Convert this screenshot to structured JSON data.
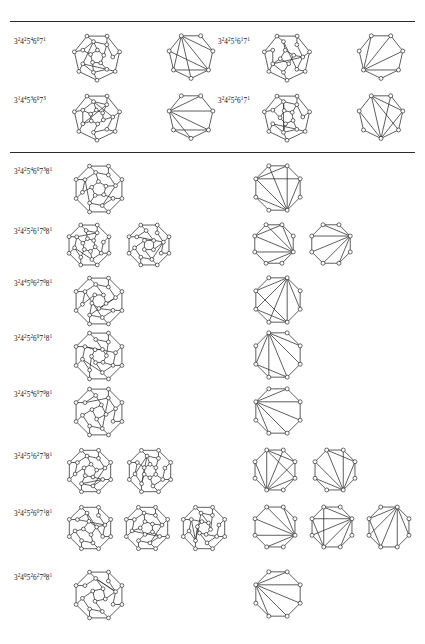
{
  "page": {
    "kind": "figure-plate",
    "width": 425,
    "height": 644,
    "background": "#ffffff",
    "ink": "#2a2a2a"
  },
  "rules": [
    {
      "name": "top-rule",
      "y": 21
    },
    {
      "name": "section-divider-rule",
      "y": 152
    }
  ],
  "notation": {
    "base_symbols": [
      "3",
      "4",
      "5",
      "6",
      "7",
      "8"
    ],
    "description": "face-vector notation 3^a 4^b 5^c 6^d 7^e 8^f"
  },
  "sections": [
    {
      "name": "section-upper",
      "columns": [
        {
          "name": "upper-left-column",
          "x": 14,
          "rows": [
            {
              "label": "3²4²5⁴6⁰7¹",
              "terms": [
                {
                  "b": "3",
                  "e": "2"
                },
                {
                  "b": "4",
                  "e": "2"
                },
                {
                  "b": "5",
                  "e": "4"
                },
                {
                  "b": "6",
                  "e": "0"
                },
                {
                  "b": "7",
                  "e": "1"
                }
              ],
              "label_y": 36,
              "figures": [
                {
                  "name": "polyhedral-graph",
                  "type": "poly",
                  "variant": 1,
                  "x": 68,
                  "y": 28,
                  "size": 58
                },
                {
                  "name": "triangulation-graph",
                  "type": "tri",
                  "variant": 1,
                  "x": 163,
                  "y": 28,
                  "size": 56
                }
              ]
            },
            {
              "label": "3¹4⁴5³6⁰7³",
              "terms": [
                {
                  "b": "3",
                  "e": "1"
                },
                {
                  "b": "4",
                  "e": "4"
                },
                {
                  "b": "5",
                  "e": "3"
                },
                {
                  "b": "6",
                  "e": "0"
                },
                {
                  "b": "7",
                  "e": "3"
                }
              ],
              "label_y": 95,
              "figures": [
                {
                  "name": "polyhedral-graph",
                  "type": "poly",
                  "variant": 2,
                  "x": 68,
                  "y": 88,
                  "size": 58
                },
                {
                  "name": "triangulation-graph",
                  "type": "tri",
                  "variant": 2,
                  "x": 163,
                  "y": 88,
                  "size": 56
                }
              ]
            }
          ]
        },
        {
          "name": "upper-right-column",
          "x": 218,
          "rows": [
            {
              "label": "3²4²5¹6¹7¹",
              "terms": [
                {
                  "b": "3",
                  "e": "2"
                },
                {
                  "b": "4",
                  "e": "2"
                },
                {
                  "b": "5",
                  "e": "1"
                },
                {
                  "b": "6",
                  "e": "1"
                },
                {
                  "b": "7",
                  "e": "1"
                }
              ],
              "label_y": 36,
              "figures": [
                {
                  "name": "polyhedral-graph",
                  "type": "poly",
                  "variant": 3,
                  "x": 258,
                  "y": 28,
                  "size": 58
                },
                {
                  "name": "triangulation-graph",
                  "type": "tri",
                  "variant": 3,
                  "x": 353,
                  "y": 28,
                  "size": 56
                }
              ]
            },
            {
              "label": "3²4²5²6¹7¹",
              "terms": [
                {
                  "b": "3",
                  "e": "2"
                },
                {
                  "b": "4",
                  "e": "2"
                },
                {
                  "b": "5",
                  "e": "2"
                },
                {
                  "b": "6",
                  "e": "1"
                },
                {
                  "b": "7",
                  "e": "1"
                }
              ],
              "label_y": 95,
              "figures": [
                {
                  "name": "polyhedral-graph",
                  "type": "poly",
                  "variant": 4,
                  "x": 258,
                  "y": 88,
                  "size": 58
                },
                {
                  "name": "triangulation-graph",
                  "type": "tri",
                  "variant": 4,
                  "x": 353,
                  "y": 88,
                  "size": 56
                }
              ]
            }
          ]
        }
      ]
    },
    {
      "name": "section-lower",
      "columns": [
        {
          "name": "lower-column",
          "x": 14,
          "rows": [
            {
              "label": "3²4²5⁴6⁰7³8¹",
              "terms": [
                {
                  "b": "3",
                  "e": "2"
                },
                {
                  "b": "4",
                  "e": "2"
                },
                {
                  "b": "5",
                  "e": "4"
                },
                {
                  "b": "6",
                  "e": "0"
                },
                {
                  "b": "7",
                  "e": "3"
                },
                {
                  "b": "8",
                  "e": "1"
                }
              ],
              "label_y": 166,
              "figures": [
                {
                  "name": "polyhedral-graph",
                  "type": "poly8",
                  "variant": 1,
                  "x": 68,
                  "y": 158,
                  "size": 62
                },
                {
                  "name": "triangulation-graph",
                  "type": "tri8",
                  "variant": 1,
                  "x": 248,
                  "y": 158,
                  "size": 60
                }
              ]
            },
            {
              "label": "3²4²5²6¹7⁰8¹",
              "terms": [
                {
                  "b": "3",
                  "e": "2"
                },
                {
                  "b": "4",
                  "e": "2"
                },
                {
                  "b": "5",
                  "e": "2"
                },
                {
                  "b": "6",
                  "e": "1"
                },
                {
                  "b": "7",
                  "e": "0"
                },
                {
                  "b": "8",
                  "e": "1"
                }
              ],
              "label_y": 226,
              "figures": [
                {
                  "name": "polyhedral-graph",
                  "type": "poly8",
                  "variant": 2,
                  "x": 62,
                  "y": 218,
                  "size": 54
                },
                {
                  "name": "polyhedral-graph",
                  "type": "poly8",
                  "variant": 3,
                  "x": 122,
                  "y": 218,
                  "size": 54
                },
                {
                  "name": "triangulation-graph",
                  "type": "tri8",
                  "variant": 2,
                  "x": 248,
                  "y": 218,
                  "size": 52
                },
                {
                  "name": "triangulation-graph",
                  "type": "tri8",
                  "variant": 3,
                  "x": 305,
                  "y": 218,
                  "size": 52
                }
              ]
            },
            {
              "label": "3²4⁴5⁰6²7⁰8¹",
              "terms": [
                {
                  "b": "3",
                  "e": "2"
                },
                {
                  "b": "4",
                  "e": "4"
                },
                {
                  "b": "5",
                  "e": "0"
                },
                {
                  "b": "6",
                  "e": "2"
                },
                {
                  "b": "7",
                  "e": "0"
                },
                {
                  "b": "8",
                  "e": "1"
                }
              ],
              "label_y": 278,
              "figures": [
                {
                  "name": "polyhedral-graph",
                  "type": "poly8",
                  "variant": 4,
                  "x": 68,
                  "y": 270,
                  "size": 62
                },
                {
                  "name": "triangulation-graph",
                  "type": "tri8",
                  "variant": 4,
                  "x": 248,
                  "y": 270,
                  "size": 60
                }
              ]
            },
            {
              "label": "3²4²5²6⁰7¹8¹",
              "terms": [
                {
                  "b": "3",
                  "e": "2"
                },
                {
                  "b": "4",
                  "e": "2"
                },
                {
                  "b": "5",
                  "e": "2"
                },
                {
                  "b": "6",
                  "e": "0"
                },
                {
                  "b": "7",
                  "e": "1"
                },
                {
                  "b": "8",
                  "e": "1"
                }
              ],
              "label_y": 333,
              "figures": [
                {
                  "name": "polyhedral-graph",
                  "type": "poly8",
                  "variant": 5,
                  "x": 68,
                  "y": 325,
                  "size": 62
                },
                {
                  "name": "triangulation-graph",
                  "type": "tri8",
                  "variant": 5,
                  "x": 248,
                  "y": 325,
                  "size": 60
                }
              ]
            },
            {
              "label": "3²4²5⁴6⁰7⁰8¹",
              "terms": [
                {
                  "b": "3",
                  "e": "2"
                },
                {
                  "b": "4",
                  "e": "2"
                },
                {
                  "b": "5",
                  "e": "4"
                },
                {
                  "b": "6",
                  "e": "0"
                },
                {
                  "b": "7",
                  "e": "0"
                },
                {
                  "b": "8",
                  "e": "1"
                }
              ],
              "label_y": 389,
              "figures": [
                {
                  "name": "polyhedral-graph",
                  "type": "poly8",
                  "variant": 6,
                  "x": 68,
                  "y": 381,
                  "size": 62
                },
                {
                  "name": "triangulation-graph",
                  "type": "tri8",
                  "variant": 6,
                  "x": 248,
                  "y": 381,
                  "size": 60
                }
              ]
            },
            {
              "label": "3²4²5¹6²7³8¹",
              "terms": [
                {
                  "b": "3",
                  "e": "2"
                },
                {
                  "b": "4",
                  "e": "2"
                },
                {
                  "b": "5",
                  "e": "1"
                },
                {
                  "b": "6",
                  "e": "2"
                },
                {
                  "b": "7",
                  "e": "3"
                },
                {
                  "b": "8",
                  "e": "1"
                }
              ],
              "label_y": 451,
              "figures": [
                {
                  "name": "polyhedral-graph",
                  "type": "poly8",
                  "variant": 7,
                  "x": 62,
                  "y": 443,
                  "size": 56
                },
                {
                  "name": "polyhedral-graph",
                  "type": "poly8",
                  "variant": 8,
                  "x": 122,
                  "y": 443,
                  "size": 56
                },
                {
                  "name": "triangulation-graph",
                  "type": "tri8",
                  "variant": 7,
                  "x": 248,
                  "y": 443,
                  "size": 54
                },
                {
                  "name": "triangulation-graph",
                  "type": "tri8",
                  "variant": 8,
                  "x": 308,
                  "y": 443,
                  "size": 54
                }
              ]
            },
            {
              "label": "3²4²5²6⁰7¹8¹",
              "terms": [
                {
                  "b": "3",
                  "e": "2"
                },
                {
                  "b": "4",
                  "e": "2"
                },
                {
                  "b": "5",
                  "e": "2"
                },
                {
                  "b": "6",
                  "e": "0"
                },
                {
                  "b": "7",
                  "e": "1"
                },
                {
                  "b": "8",
                  "e": "1"
                }
              ],
              "label_y": 508,
              "figures": [
                {
                  "name": "polyhedral-graph",
                  "type": "poly8",
                  "variant": 9,
                  "x": 62,
                  "y": 500,
                  "size": 56
                },
                {
                  "name": "polyhedral-graph",
                  "type": "poly8",
                  "variant": 10,
                  "x": 119,
                  "y": 500,
                  "size": 56
                },
                {
                  "name": "polyhedral-graph",
                  "type": "poly8",
                  "variant": 11,
                  "x": 176,
                  "y": 500,
                  "size": 56
                },
                {
                  "name": "triangulation-graph",
                  "type": "tri8",
                  "variant": 9,
                  "x": 248,
                  "y": 500,
                  "size": 54
                },
                {
                  "name": "triangulation-graph",
                  "type": "tri8",
                  "variant": 10,
                  "x": 305,
                  "y": 500,
                  "size": 54
                },
                {
                  "name": "triangulation-graph",
                  "type": "tri8",
                  "variant": 11,
                  "x": 362,
                  "y": 500,
                  "size": 54
                }
              ]
            },
            {
              "label": "3²4⁰5²6²7⁰8¹",
              "terms": [
                {
                  "b": "3",
                  "e": "2"
                },
                {
                  "b": "4",
                  "e": "0"
                },
                {
                  "b": "5",
                  "e": "2"
                },
                {
                  "b": "6",
                  "e": "2"
                },
                {
                  "b": "7",
                  "e": "0"
                },
                {
                  "b": "8",
                  "e": "1"
                }
              ],
              "label_y": 572,
              "figures": [
                {
                  "name": "polyhedral-graph",
                  "type": "poly8",
                  "variant": 12,
                  "x": 68,
                  "y": 564,
                  "size": 62
                },
                {
                  "name": "triangulation-graph",
                  "type": "tri8",
                  "variant": 12,
                  "x": 248,
                  "y": 564,
                  "size": 60
                }
              ]
            }
          ]
        }
      ]
    }
  ]
}
